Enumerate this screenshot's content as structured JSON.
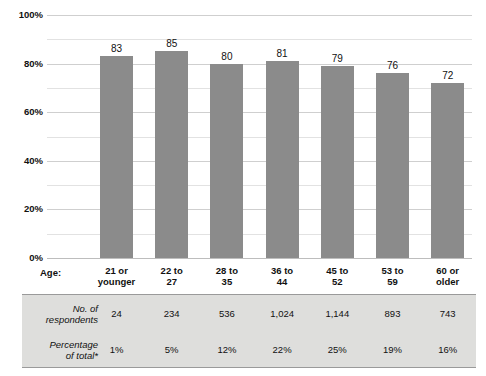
{
  "chart_data": {
    "type": "bar",
    "title": "",
    "xlabel": "Age:",
    "ylabel": "",
    "ylim": [
      0,
      100
    ],
    "grid": true,
    "legend": "none",
    "categories": [
      "21 or younger",
      "22 to 27",
      "28 to 35",
      "36 to 44",
      "45 to 52",
      "53 to 59",
      "60 or older"
    ],
    "values": [
      83,
      85,
      80,
      81,
      79,
      76,
      72
    ],
    "value_labels": [
      "83",
      "85",
      "80",
      "81",
      "79",
      "76",
      "72"
    ],
    "ytick_labels": [
      "100%",
      "80%",
      "60%",
      "40%",
      "20%",
      "0%"
    ],
    "ytick_values": [
      100,
      80,
      60,
      40,
      20,
      0
    ],
    "minor_ytick_values": [
      90,
      70,
      50,
      30,
      10
    ],
    "bar_color": "#8b8b8b",
    "gridline_color": "#e2e2e2"
  },
  "axis": {
    "age_label": "Age:"
  },
  "table": {
    "background_color": "#dededc",
    "rows": [
      {
        "header_line1": "No. of",
        "header_line2": "respondents",
        "cells": [
          "24",
          "234",
          "536",
          "1,024",
          "1,144",
          "893",
          "743"
        ]
      },
      {
        "header_line1": "Percentage",
        "header_line2": "of total*",
        "cells": [
          "1%",
          "5%",
          "12%",
          "22%",
          "25%",
          "19%",
          "16%"
        ]
      }
    ]
  }
}
